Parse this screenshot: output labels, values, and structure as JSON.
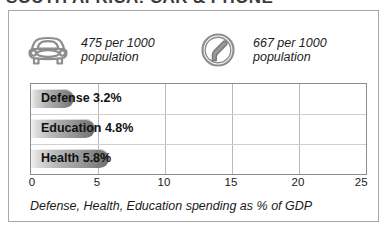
{
  "title": "SOUTH AFRICA: CAR & PHONE",
  "stats": [
    {
      "icon": "car-icon",
      "value": "475 per 1000",
      "unit": "population"
    },
    {
      "icon": "telephone-handset-icon",
      "value": "667 per 1000",
      "unit": "population"
    }
  ],
  "caption": "Defense, Health, Education spending as % of GDP",
  "chart_data": {
    "type": "bar",
    "orientation": "horizontal",
    "categories": [
      "Defense",
      "Education",
      "Health"
    ],
    "values": [
      3.2,
      4.8,
      5.8
    ],
    "data_labels": [
      "Defense 3.2%",
      "Education 4.8%",
      "Health 5.8%"
    ],
    "title": "",
    "xlabel": "Defense, Health, Education spending as % of GDP",
    "ylabel": "",
    "xlim": [
      0,
      25
    ],
    "xticks": [
      0,
      5,
      10,
      15,
      20,
      25
    ],
    "xtick_labels": [
      "0",
      "5",
      "10",
      "15",
      "20",
      "25"
    ],
    "grid": true,
    "legend": "none",
    "bar_color": "#9a9a9a"
  },
  "colors": {
    "frame": "#a9a9a9",
    "plot_border": "#8c8c8c",
    "gridline": "#b9b9b9",
    "text": "#1a1a1a",
    "bar_dark": "#6e6e6e",
    "bar_light": "#f2f2f2"
  }
}
